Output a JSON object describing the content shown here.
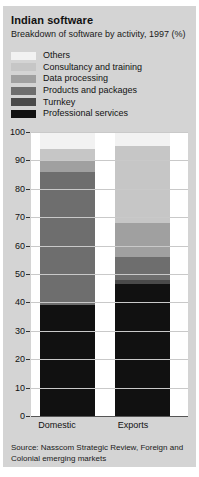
{
  "title": "Indian software",
  "subtitle": "Breakdown of software by activity, 1997 (%)",
  "source": "Source: Nasscom Strategic Review, Foreign and Colonial emerging markets",
  "colors": {
    "card_background": "#d4d4d4",
    "plot_background": "#ffffff",
    "others": "#f2f2f2",
    "consultancy": "#c6c6c6",
    "data_processing": "#a0a0a0",
    "products": "#6e6e6e",
    "turnkey": "#4a4a4a",
    "professional": "#111111",
    "gridline": "#c9c9c9"
  },
  "legend": {
    "items": [
      {
        "label": "Others",
        "color": "#f2f2f2"
      },
      {
        "label": "Consultancy and training",
        "color": "#c6c6c6"
      },
      {
        "label": "Data processing",
        "color": "#a0a0a0"
      },
      {
        "label": "Products and packages",
        "color": "#6e6e6e"
      },
      {
        "label": "Turnkey",
        "color": "#4a4a4a"
      },
      {
        "label": "Professional services",
        "color": "#111111"
      }
    ]
  },
  "axis": {
    "ticks": [
      "100",
      "90",
      "80",
      "70",
      "60",
      "50",
      "40",
      "30",
      "20",
      "10",
      "0"
    ]
  },
  "chart_data": {
    "type": "bar",
    "title": "Indian software",
    "subtitle": "Breakdown of software by activity, 1997 (%)",
    "xlabel": "",
    "ylabel": "",
    "ylim": [
      0,
      100
    ],
    "stacked": true,
    "grid": true,
    "legend_position": "top",
    "categories": [
      "Domestic",
      "Exports"
    ],
    "series": [
      {
        "name": "Professional services",
        "color": "#111111",
        "values": [
          39,
          46.5
        ]
      },
      {
        "name": "Turnkey",
        "color": "#4a4a4a",
        "values": [
          0,
          1.5
        ]
      },
      {
        "name": "Products and packages",
        "color": "#6e6e6e",
        "values": [
          47,
          8
        ]
      },
      {
        "name": "Data processing",
        "color": "#a0a0a0",
        "values": [
          4,
          12
        ]
      },
      {
        "name": "Consultancy and training",
        "color": "#c6c6c6",
        "values": [
          4,
          27
        ]
      },
      {
        "name": "Others",
        "color": "#f2f2f2",
        "values": [
          6,
          5
        ]
      }
    ],
    "annotations": [
      "Source: Nasscom Strategic Review, Foreign and Colonial emerging markets"
    ]
  }
}
